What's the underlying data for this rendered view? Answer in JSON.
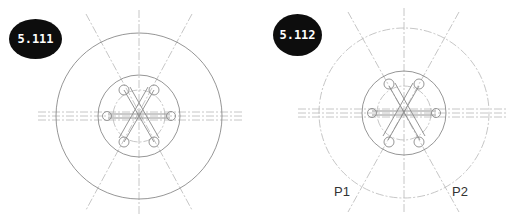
{
  "figures": [
    {
      "id": "left",
      "label": "5.111",
      "center": [
        139,
        116
      ],
      "outer_radius": 83,
      "middle_radius": 41,
      "inner_dashed_radius": 26
    },
    {
      "id": "right",
      "label": "5.112",
      "center": [
        404,
        111
      ],
      "outer_radius": 85,
      "middle_radius": 42,
      "inner_dashed_radius": 27,
      "points": [
        {
          "label": "P1"
        },
        {
          "label": "P2"
        }
      ]
    }
  ],
  "colors": {
    "line": "#8a8a8a",
    "centerline": "#b5b5b5",
    "badge_bg": "#0d0d0d",
    "badge_text": "#ffffff"
  }
}
